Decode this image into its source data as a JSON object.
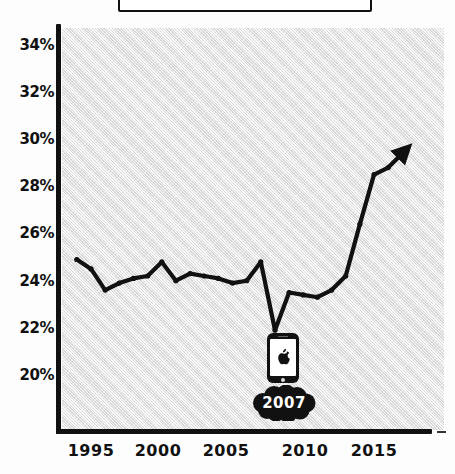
{
  "chart_data": {
    "type": "line",
    "title": "",
    "subtitle": "",
    "xlabel": "",
    "ylabel": "",
    "xlim": [
      1993.5,
      2017.5
    ],
    "ylim": [
      19.0,
      35.0
    ],
    "grid": false,
    "legend_position": "none",
    "y_tick_labels": [
      "34%",
      "32%",
      "30%",
      "28%",
      "26%",
      "24%",
      "22%",
      "20%"
    ],
    "y_tick_values": [
      34,
      32,
      30,
      28,
      26,
      24,
      22,
      20
    ],
    "x_tick_labels": [
      "1995",
      "2000",
      "2005",
      "2010",
      "2015"
    ],
    "x_tick_values": [
      1995,
      2000,
      2005,
      2010,
      2015
    ],
    "series": [
      {
        "name": "share",
        "x": [
          1994,
          1995,
          1996,
          1997,
          1998,
          1999,
          2000,
          2001,
          2002,
          2003,
          2004,
          2005,
          2006,
          2007,
          2008,
          2009,
          2010,
          2011,
          2012,
          2013,
          2014,
          2015,
          2016,
          2017
        ],
        "values": [
          24.9,
          24.5,
          23.6,
          23.9,
          24.1,
          24.2,
          24.8,
          24.0,
          24.3,
          24.2,
          24.1,
          23.9,
          24.0,
          24.8,
          21.9,
          23.5,
          23.4,
          23.3,
          23.6,
          24.2,
          26.4,
          28.5,
          28.8,
          29.4
        ],
        "marker": "dot",
        "arrow_at_end": true,
        "color": "#111111"
      }
    ],
    "annotations": [
      {
        "name": "iphone-launch",
        "year_label": "2007",
        "icon": "iphone-icon",
        "logo": "apple-logo-icon"
      }
    ]
  },
  "axes": {
    "y_ticks": [
      {
        "label": "34%",
        "y": 45
      },
      {
        "label": "32%",
        "y": 92
      },
      {
        "label": "30%",
        "y": 139
      },
      {
        "label": "28%",
        "y": 186
      },
      {
        "label": "26%",
        "y": 233
      },
      {
        "label": "24%",
        "y": 281
      },
      {
        "label": "22%",
        "y": 328
      },
      {
        "label": "20%",
        "y": 375
      }
    ],
    "x_ticks": [
      {
        "label": "1995",
        "x": 91
      },
      {
        "label": "2000",
        "x": 158
      },
      {
        "label": "2005",
        "x": 226
      },
      {
        "label": "2010",
        "x": 305
      },
      {
        "label": "2015",
        "x": 374
      }
    ]
  },
  "annotation": {
    "year": "2007"
  },
  "colors": {
    "line": "#111111",
    "plot_background": "#d4d4d4",
    "page_background": "#fdfdfd",
    "text": "#111111",
    "blob_text": "#ffffff"
  }
}
